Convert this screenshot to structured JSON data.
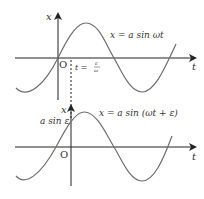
{
  "top_graph": {
    "x_axis_label": "t",
    "y_axis_label": "x",
    "origin_label": "O",
    "equation": "x = a sin ωt",
    "marker_label_t": "t =",
    "marker_frac_num": "ε",
    "marker_frac_den": "ω"
  },
  "bottom_graph": {
    "x_axis_label": "t",
    "y_axis_label": "x",
    "origin_label": "O",
    "equation": "x = a sin (ωt + ε)",
    "intercept_label": "a sin ε"
  },
  "colors": {
    "axis": "#222222",
    "curve": "#6e6e6e",
    "text": "#333333"
  }
}
